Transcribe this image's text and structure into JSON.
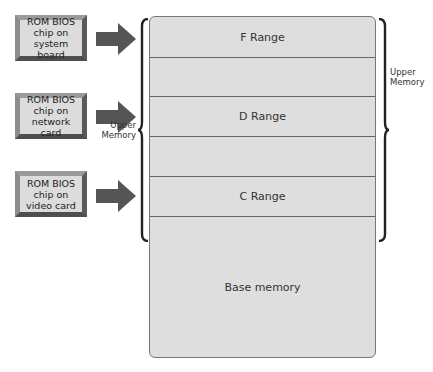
{
  "chips": [
    {
      "label_lines": [
        "ROM BIOS",
        "chip on",
        "system board"
      ]
    },
    {
      "label_lines": [
        "ROM BIOS",
        "chip on",
        "network card"
      ]
    },
    {
      "label_lines": [
        "ROM BIOS",
        "chip on",
        "video card"
      ]
    }
  ],
  "memory_map": {
    "rows": [
      {
        "label": "F Range"
      },
      {
        "label": ""
      },
      {
        "label": "D Range"
      },
      {
        "label": ""
      },
      {
        "label": "C Range"
      },
      {
        "label": "Base memory"
      }
    ]
  },
  "braces": {
    "left_label_line1": "Upper",
    "left_label_line2": "Memory",
    "right_label_line1": "Upper",
    "right_label_line2": "Memory"
  },
  "colors": {
    "chip_face": "#dcdcdc",
    "chip_frame": "#7a7a7a",
    "arrow": "#555555",
    "memory_fill": "#dedede",
    "brace": "#222222"
  }
}
